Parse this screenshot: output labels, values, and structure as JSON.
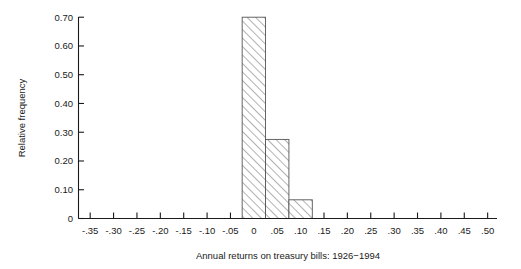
{
  "chart_data": {
    "type": "bar",
    "title": "",
    "subtitle": "",
    "xlabel": "Annual returns on treasury bills: 1926−1994",
    "ylabel": "Relative frequency",
    "xlim": [
      -0.375,
      0.52
    ],
    "ylim": [
      0,
      0.7
    ],
    "grid": false,
    "legend": null,
    "bin_width": 0.05,
    "xticks": [
      -0.35,
      -0.3,
      -0.25,
      -0.2,
      -0.15,
      -0.1,
      -0.05,
      0,
      0.05,
      0.1,
      0.15,
      0.2,
      0.25,
      0.3,
      0.35,
      0.4,
      0.45,
      0.5
    ],
    "xticklabels": [
      "-.35",
      "-.30",
      "-.25",
      "-.20",
      "-.15",
      "-.10",
      "-.05",
      "0",
      ".05",
      ".10",
      ".15",
      ".20",
      ".25",
      ".30",
      ".35",
      ".40",
      ".45",
      ".50"
    ],
    "yticks": [
      0,
      0.1,
      0.2,
      0.3,
      0.4,
      0.5,
      0.6,
      0.7
    ],
    "yticklabels": [
      "0",
      "0.10",
      "0.20",
      "0.30",
      "0.40",
      "0.50",
      "0.60",
      "0.70"
    ],
    "bins": [
      {
        "label": "-.025 to .025",
        "left": -0.025,
        "right": 0.025,
        "center": 0.0,
        "value": 0.7
      },
      {
        "label": ".025 to .075",
        "left": 0.025,
        "right": 0.075,
        "center": 0.05,
        "value": 0.275
      },
      {
        "label": ".075 to .125",
        "left": 0.075,
        "right": 0.125,
        "center": 0.1,
        "value": 0.065
      }
    ],
    "categories": [
      "0",
      ".05",
      ".10"
    ],
    "values": [
      0.7,
      0.275,
      0.065
    ],
    "bar_style": {
      "fill": "diagonal-hatch",
      "hatch_angle_deg": 45,
      "edge_color": "#555555",
      "face_color": "#ffffff"
    }
  },
  "figure": {
    "background_color": "#ffffff",
    "text_color": "#1a1a1a"
  }
}
